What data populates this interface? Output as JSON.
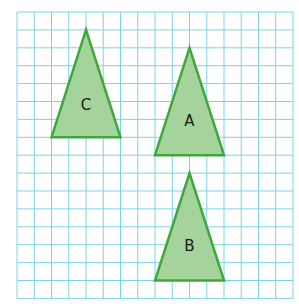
{
  "grid": {
    "columns": 16,
    "rows": 16,
    "origin_px": [
      17,
      12
    ],
    "cell_w": 17.25,
    "cell_h": 17.9,
    "line_color": "#7dd3e6"
  },
  "style": {
    "fill": "#a5d39c",
    "stroke": "#3fa83c",
    "stroke_width": 2.5
  },
  "shapes": [
    {
      "id": "C",
      "label": "C",
      "vertices": [
        [
          4,
          1
        ],
        [
          2,
          7
        ],
        [
          6,
          7
        ]
      ],
      "label_pos": [
        4,
        5.2
      ]
    },
    {
      "id": "A",
      "label": "A",
      "vertices": [
        [
          10,
          2
        ],
        [
          8,
          8
        ],
        [
          12,
          8
        ]
      ],
      "label_pos": [
        10,
        6.1
      ]
    },
    {
      "id": "B",
      "label": "B",
      "vertices": [
        [
          10,
          9
        ],
        [
          8,
          15
        ],
        [
          12,
          15
        ]
      ],
      "label_pos": [
        10,
        13.1
      ]
    }
  ]
}
